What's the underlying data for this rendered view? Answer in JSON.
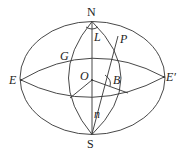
{
  "diagram": {
    "type": "celestial-sphere",
    "stroke_color": "#333333",
    "labels": {
      "N": "N",
      "S": "S",
      "E": "E",
      "E_prime": "E′",
      "O": "O",
      "G": "G",
      "P": "P",
      "L": "L",
      "B": "B",
      "n": "n"
    }
  }
}
